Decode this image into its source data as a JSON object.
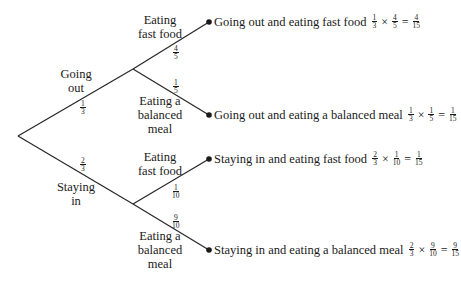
{
  "tree": {
    "level1": [
      {
        "label_line1": "Going",
        "label_line2": "out",
        "prob_num": "1",
        "prob_den": "3"
      },
      {
        "label_line1": "Staying",
        "label_line2": "in",
        "prob_num": "2",
        "prob_den": "3"
      }
    ],
    "level2": [
      {
        "label_line1": "Eating",
        "label_line2": "fast food",
        "prob_num": "4",
        "prob_den": "5"
      },
      {
        "label_line1": "Eating a",
        "label_line2": "balanced",
        "label_line3": "meal",
        "prob_num": "1",
        "prob_den": "5"
      },
      {
        "label_line1": "Eating",
        "label_line2": "fast food",
        "prob_num": "1",
        "prob_den": "10"
      },
      {
        "label_line1": "Eating a",
        "label_line2": "balanced",
        "label_line3": "meal",
        "prob_num": "9",
        "prob_den": "10"
      }
    ],
    "outcomes": [
      {
        "text": "Going out and eating fast food",
        "a_num": "1",
        "a_den": "3",
        "times": "×",
        "b_num": "4",
        "b_den": "5",
        "equals": "=",
        "r_num": "4",
        "r_den": "15"
      },
      {
        "text": "Going out and eating a balanced meal",
        "a_num": "1",
        "a_den": "3",
        "times": "×",
        "b_num": "1",
        "b_den": "5",
        "equals": "=",
        "r_num": "1",
        "r_den": "15"
      },
      {
        "text": "Staying in and eating fast food",
        "a_num": "2",
        "a_den": "3",
        "times": "×",
        "b_num": "1",
        "b_den": "10",
        "equals": "=",
        "r_num": "1",
        "r_den": "15"
      },
      {
        "text": "Staying in and eating a balanced meal",
        "a_num": "2",
        "a_den": "3",
        "times": "×",
        "b_num": "9",
        "b_den": "10",
        "equals": "=",
        "r_num": "9",
        "r_den": "15"
      }
    ]
  },
  "colors": {
    "line": "#2a2a2a",
    "text": "#1a1a1a",
    "background": "#ffffff"
  }
}
